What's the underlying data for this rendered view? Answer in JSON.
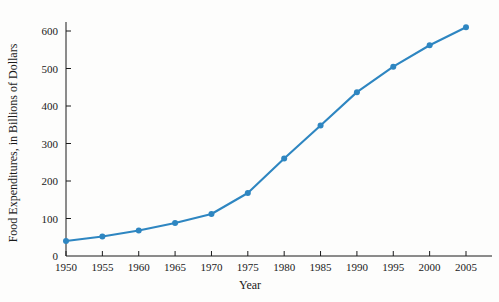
{
  "chart_data": {
    "type": "line",
    "title": "",
    "xlabel": "Year",
    "ylabel": "Food Expenditures, in Billions of Dollars",
    "x": [
      1950,
      1955,
      1960,
      1965,
      1970,
      1975,
      1980,
      1985,
      1990,
      1995,
      2000,
      2005
    ],
    "values": [
      40,
      52,
      68,
      88,
      112,
      168,
      260,
      348,
      437,
      505,
      562,
      610
    ],
    "series": [
      {
        "name": "Food Expenditures",
        "values": [
          40,
          52,
          68,
          88,
          112,
          168,
          260,
          348,
          437,
          505,
          562,
          610
        ]
      }
    ],
    "xtick_labels": [
      "1950",
      "1955",
      "1960",
      "1965",
      "1970",
      "1975",
      "1980",
      "1985",
      "1990",
      "1995",
      "2000",
      "2005"
    ],
    "ytick_labels": [
      "0",
      "100",
      "200",
      "300",
      "400",
      "500",
      "600"
    ],
    "ytick_values": [
      0,
      100,
      200,
      300,
      400,
      500,
      600
    ],
    "xlim": [
      1950,
      2005
    ],
    "ylim": [
      0,
      640
    ],
    "grid": false,
    "legend": "none",
    "line_color": "#2E86C1",
    "marker_color": "#2E86C1",
    "axis_color": "#1a1a1a",
    "background_color": "#fdfdfc"
  }
}
